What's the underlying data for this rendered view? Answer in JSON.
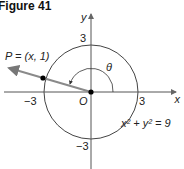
{
  "figure": {
    "title": "Figure 41",
    "axes": {
      "x_label": "x",
      "y_label": "y"
    },
    "ticks": {
      "pos_x": "3",
      "neg_x": "−3",
      "pos_y": "3",
      "neg_y": "−3"
    },
    "origin_label": "O",
    "point_label": "P = (x, 1)",
    "angle_label": "θ",
    "equation": "x² + y² = 9",
    "colors": {
      "terminal_side": "#8a8a8a",
      "axis": "#555555",
      "circle": "#444444"
    }
  }
}
